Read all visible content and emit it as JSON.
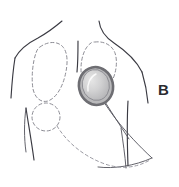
{
  "figure": {
    "panel_label": "B",
    "panel_label_position": {
      "x": 158,
      "y": 82
    },
    "canvas": {
      "width": 179,
      "height": 187
    },
    "background_color": "#ffffff"
  },
  "colors": {
    "body_outline": "#3a3a42",
    "lead_line": "#51515a",
    "dashed_outline": "#8d8d95",
    "device_ring": "#6e6e73",
    "device_fill_light": "#d8d8d8",
    "device_fill_mid": "#bdbdbf",
    "device_highlight": "#ffffff",
    "label_text": "#2b2b30"
  },
  "elements": {
    "torso": {
      "name": "body-outline",
      "parts": [
        {
          "id": "left-neck-shoulder",
          "label": "Left neck and shoulder contour"
        },
        {
          "id": "right-neck-shoulder",
          "label": "Right neck and shoulder contour"
        },
        {
          "id": "left-arm-outer",
          "label": "Left outer arm line"
        },
        {
          "id": "right-arm-outer",
          "label": "Right outer arm line"
        },
        {
          "id": "left-arm-inner",
          "label": "Left inner arm line"
        },
        {
          "id": "right-arm-inner",
          "label": "Right inner arm line"
        },
        {
          "id": "sternal-midline",
          "label": "Sternal midline"
        }
      ]
    },
    "breast_outline_left": {
      "name": "breast-outline-left",
      "style": "dashed",
      "label": "Left breast tissue outline"
    },
    "breast_outline_right": {
      "name": "breast-outline-right",
      "style": "dashed",
      "label": "Right breast tissue outline"
    },
    "lesion_marker": {
      "name": "lesion-marker",
      "style": "dashed-circle",
      "label": "Dashed circular lesion marker",
      "center": {
        "x": 46,
        "y": 117
      },
      "radius": 14
    },
    "incision_arc": {
      "name": "incision-arc",
      "style": "dashed",
      "label": "Dashed incision / tunneling arc"
    },
    "device": {
      "name": "implanted-device",
      "label": "Implanted oval device (port / generator)",
      "shape": "ellipse",
      "center": {
        "x": 96,
        "y": 86
      },
      "radius_x": 17,
      "radius_y": 19,
      "rotation_deg": -12
    },
    "device_lead": {
      "name": "device-lead-line",
      "label": "Lead / catheter from device"
    },
    "costal_arc": {
      "name": "costal-arc",
      "label": "Lower rib / flank contour arc"
    }
  }
}
